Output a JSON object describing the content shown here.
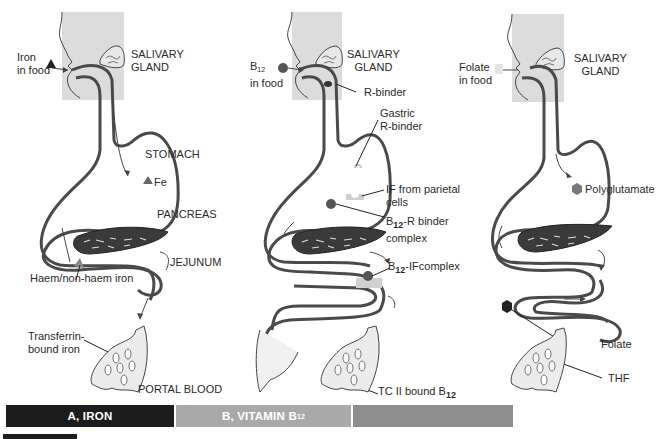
{
  "figure": {
    "panels": [
      {
        "id": "iron",
        "caption": {
          "prefix": "A, IRON",
          "sub": ""
        },
        "caption_bg": "#1c1c1c",
        "labels": {
          "food_line1": "Iron",
          "food_line2": "in food",
          "salivary_line1": "SALIVARY",
          "salivary_line2": "GLAND",
          "stomach": "STOMACH",
          "fe": "Fe",
          "pancreas": "PANCREAS",
          "jejunum": "JEJUNUM",
          "haem": "Haem/non-haem iron",
          "transferrin_line1": "Transferrin-",
          "transferrin_line2": "bound iron",
          "portal": "PORTAL BLOOD"
        },
        "food_marker": "triangle-icon"
      },
      {
        "id": "vitamin-b12",
        "caption": {
          "prefix": "B, VITAMIN B",
          "sub": "12"
        },
        "caption_bg": "#a9a9a9",
        "labels": {
          "food_line1": "B",
          "food_sub": "12",
          "food_line2": "in food",
          "salivary_line1": "SALIVARY",
          "salivary_line2": "GLAND",
          "r_binder": "R-binder",
          "gastric_line1": "Gastric",
          "gastric_line2": "R-binder",
          "if_line1": "IF from parietal",
          "if_line2": "cells",
          "b12r_prefix": "B",
          "b12r_sub": "12",
          "b12r_suffix": "-R binder",
          "b12r_line2": "complex",
          "b12if_prefix": "B",
          "b12if_sub": "12",
          "b12if_suffix": "-IFcomplex",
          "tc_prefix": "TC II bound B",
          "tc_sub": "12"
        },
        "food_marker": "circle-icon"
      },
      {
        "id": "folate",
        "caption": {
          "prefix": "C, FOLATE",
          "sub": ""
        },
        "caption_bg": "#8e8e8e",
        "labels": {
          "food_line1": "Folate",
          "food_line2": "in food",
          "salivary_line1": "SALIVARY",
          "salivary_line2": "GLAND",
          "polyglutamate": "Polyglutamate",
          "folate": "Folate",
          "thf": "THF"
        },
        "food_marker": "square-icon"
      }
    ],
    "colors": {
      "tract_stroke": "#4a4a4a",
      "head_fill": "#dcdcdc",
      "pancreas_fill": "#3a3a3a",
      "marker_dark": "#555555",
      "marker_light": "#cfcfcf"
    }
  }
}
